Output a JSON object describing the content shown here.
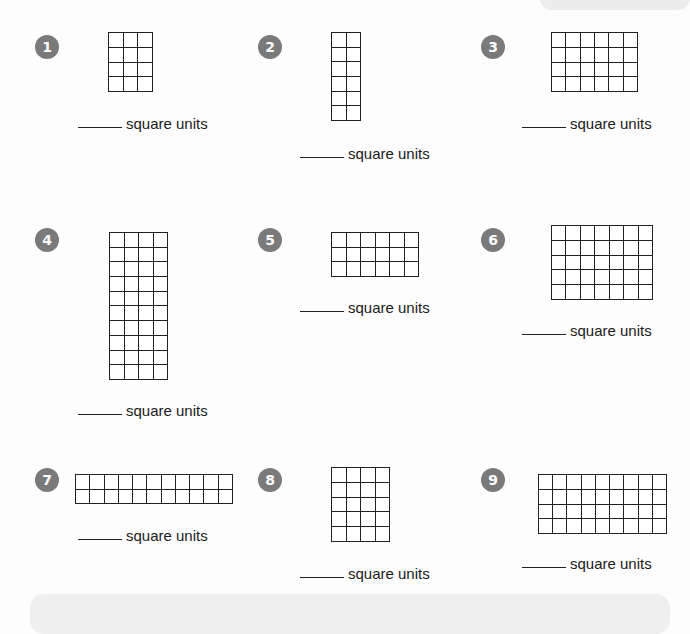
{
  "worksheet": {
    "unit_label": "square units",
    "problems": [
      {
        "number": "1",
        "cols": 3,
        "rows": 4,
        "answer": ""
      },
      {
        "number": "2",
        "cols": 2,
        "rows": 6,
        "answer": ""
      },
      {
        "number": "3",
        "cols": 6,
        "rows": 4,
        "answer": ""
      },
      {
        "number": "4",
        "cols": 4,
        "rows": 10,
        "answer": ""
      },
      {
        "number": "5",
        "cols": 6,
        "rows": 3,
        "answer": ""
      },
      {
        "number": "6",
        "cols": 7,
        "rows": 5,
        "answer": ""
      },
      {
        "number": "7",
        "cols": 11,
        "rows": 2,
        "answer": ""
      },
      {
        "number": "8",
        "cols": 4,
        "rows": 5,
        "answer": ""
      },
      {
        "number": "9",
        "cols": 9,
        "rows": 4,
        "answer": ""
      }
    ]
  },
  "colors": {
    "badge": "#7a7a7a",
    "grid_line": "#222222",
    "background": "#fdfdfd"
  }
}
